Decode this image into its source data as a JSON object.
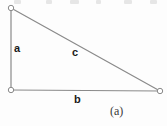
{
  "figure": {
    "canvas": {
      "width": 167,
      "height": 126,
      "background": "#fdfdfd"
    },
    "caption": "(a)",
    "stroke_color": "#8a8a8a",
    "vertex_fill": "#ffffff",
    "label_color": "#1a1a1a",
    "caption_color": "#3a3a3a",
    "vertices": [
      {
        "name": "top-left-vertex",
        "x": 11,
        "y": 8
      },
      {
        "name": "bottom-left-vertex",
        "x": 11,
        "y": 90
      },
      {
        "name": "bottom-right-vertex",
        "x": 160,
        "y": 91
      }
    ],
    "edges": [
      {
        "name": "vertical-leg",
        "label": "a",
        "from": "top-left-vertex",
        "to": "bottom-left-vertex"
      },
      {
        "name": "horizontal-leg",
        "label": "b",
        "from": "bottom-left-vertex",
        "to": "bottom-right-vertex"
      },
      {
        "name": "hypotenuse",
        "label": "c",
        "from": "top-left-vertex",
        "to": "bottom-right-vertex"
      }
    ],
    "labels": {
      "leg_a": "a",
      "leg_b": "b",
      "hypotenuse_c": "c"
    },
    "top_artifacts": [
      {
        "left": 14,
        "width": 7
      },
      {
        "left": 46,
        "width": 6
      },
      {
        "left": 70,
        "width": 9
      },
      {
        "left": 96,
        "width": 5
      },
      {
        "left": 124,
        "width": 8
      },
      {
        "left": 150,
        "width": 7
      }
    ]
  }
}
